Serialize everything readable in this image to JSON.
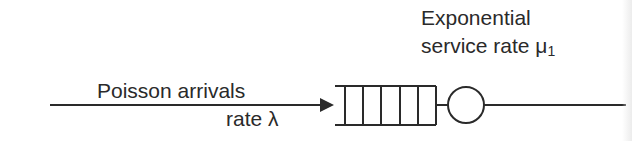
{
  "diagram": {
    "arrival": {
      "label_line1": "Poisson arrivals",
      "label_line2": "rate λ"
    },
    "service": {
      "label_line1": "Exponential",
      "label_line2": "service rate μ",
      "subscript": "1"
    },
    "queue": {
      "slots": 5
    },
    "colors": {
      "stroke": "#2a2a2a",
      "text": "#2a2a2a",
      "background": "#ffffff"
    }
  }
}
